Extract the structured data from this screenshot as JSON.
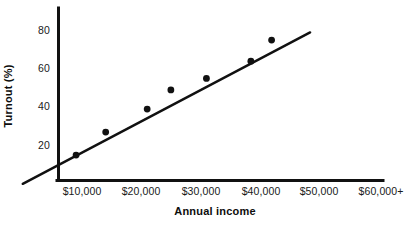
{
  "chart_data": {
    "type": "scatter",
    "title": "",
    "xlabel": "Annual income",
    "ylabel": "Turnout (%)",
    "categories": [
      "$10,000",
      "$20,000",
      "$30,000",
      "$40,000",
      "$50,000",
      "$60,000+"
    ],
    "x_tick_labels": [
      "$10,000",
      "$20,000",
      "$30,000",
      "$40,000",
      "$50,000",
      "$60,000+"
    ],
    "y_tick_labels": [
      "20",
      "40",
      "60",
      "80"
    ],
    "y_ticks": [
      20,
      40,
      60,
      80
    ],
    "ylim": [
      0,
      88
    ],
    "xlim": [
      0,
      68000
    ],
    "grid": false,
    "legend": false,
    "series": [
      {
        "name": "Turnout by income",
        "marker": "filled-circle",
        "color": "#111111",
        "points": [
          {
            "x": 9000,
            "y": 15
          },
          {
            "x": 14000,
            "y": 27
          },
          {
            "x": 21000,
            "y": 39
          },
          {
            "x": 25000,
            "y": 49
          },
          {
            "x": 31000,
            "y": 55
          },
          {
            "x": 38500,
            "y": 64
          },
          {
            "x": 42000,
            "y": 75
          }
        ]
      }
    ],
    "trend_line": {
      "name": "fitted line",
      "color": "#111111",
      "start": {
        "x": 0,
        "y": 0
      },
      "end": {
        "x": 48500,
        "y": 79
      }
    },
    "annotations": []
  },
  "axes": {
    "x_title": "Annual income",
    "y_title": "Turnout (%)",
    "axis_color": "#111111"
  }
}
